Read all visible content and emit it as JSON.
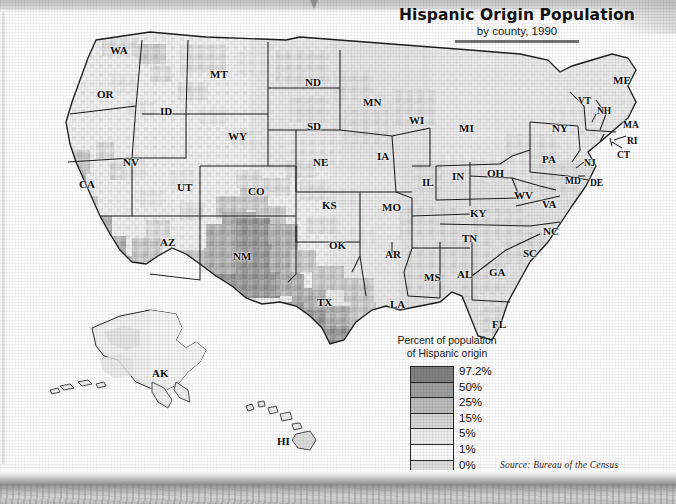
{
  "title": {
    "main": "Hispanic Origin Population",
    "subtitle": "by county, 1990"
  },
  "legend": {
    "title_line1": "Percent of population",
    "title_line2": "of Hispanic origin",
    "entries": [
      {
        "label": "97.2%",
        "color": "#818181"
      },
      {
        "label": "50%",
        "color": "#9e9e9e"
      },
      {
        "label": "25%",
        "color": "#bcbcbc"
      },
      {
        "label": "15%",
        "color": "#d6d6d6"
      },
      {
        "label": "5%",
        "color": "#ececec"
      },
      {
        "label": "1%",
        "color": "#fbfbfb"
      },
      {
        "label": "0%",
        "color": "#dedede"
      }
    ]
  },
  "source": "Source:  Bureau of the Census",
  "chart_data": {
    "type": "heatmap",
    "title": "Hispanic Origin Population",
    "subtitle": "by county, 1990",
    "variable": "Percent of population of Hispanic origin",
    "unit": "percent",
    "geography": "United States counties",
    "year": 1990,
    "legend_breaks": [
      0,
      1,
      5,
      15,
      25,
      50,
      97.2
    ],
    "legend_labels": [
      "0%",
      "1%",
      "5%",
      "15%",
      "25%",
      "50%",
      "97.2%"
    ],
    "colormap": [
      "#dedede",
      "#fbfbfb",
      "#ececec",
      "#d6d6d6",
      "#bcbcbc",
      "#9e9e9e",
      "#818181"
    ],
    "source": "Bureau of the Census",
    "series": [
      {
        "name": "NM",
        "value": 50,
        "note": "highest statewide shading; many counties above 50%"
      },
      {
        "name": "TX",
        "value": 25,
        "note": "southern and border counties darkest"
      },
      {
        "name": "CA",
        "value": 25,
        "note": "southern counties and Central Valley dark"
      },
      {
        "name": "AZ",
        "value": 15,
        "note": "southern border counties dark"
      },
      {
        "name": "CO",
        "value": 15,
        "note": "southern counties dark"
      },
      {
        "name": "NV",
        "value": 5
      },
      {
        "name": "UT",
        "value": 5
      },
      {
        "name": "ID",
        "value": 5
      },
      {
        "name": "OR",
        "value": 5
      },
      {
        "name": "WA",
        "value": 5
      },
      {
        "name": "WY",
        "value": 5
      },
      {
        "name": "MT",
        "value": 1
      },
      {
        "name": "ND",
        "value": 1
      },
      {
        "name": "SD",
        "value": 1
      },
      {
        "name": "NE",
        "value": 5
      },
      {
        "name": "KS",
        "value": 5
      },
      {
        "name": "OK",
        "value": 1
      },
      {
        "name": "MN",
        "value": 1
      },
      {
        "name": "IA",
        "value": 1
      },
      {
        "name": "MO",
        "value": 1
      },
      {
        "name": "AR",
        "value": 1
      },
      {
        "name": "LA",
        "value": 1
      },
      {
        "name": "WI",
        "value": 1
      },
      {
        "name": "IL",
        "value": 5
      },
      {
        "name": "MI",
        "value": 1
      },
      {
        "name": "IN",
        "value": 1
      },
      {
        "name": "OH",
        "value": 1
      },
      {
        "name": "KY",
        "value": 1
      },
      {
        "name": "TN",
        "value": 1
      },
      {
        "name": "MS",
        "value": 1
      },
      {
        "name": "AL",
        "value": 1
      },
      {
        "name": "GA",
        "value": 1
      },
      {
        "name": "FL",
        "value": 5
      },
      {
        "name": "SC",
        "value": 1
      },
      {
        "name": "NC",
        "value": 1
      },
      {
        "name": "VA",
        "value": 1
      },
      {
        "name": "WV",
        "value": 1
      },
      {
        "name": "MD",
        "value": 1
      },
      {
        "name": "DE",
        "value": 1
      },
      {
        "name": "PA",
        "value": 1
      },
      {
        "name": "NJ",
        "value": 5
      },
      {
        "name": "NY",
        "value": 5
      },
      {
        "name": "CT",
        "value": 5
      },
      {
        "name": "RI",
        "value": 5
      },
      {
        "name": "MA",
        "value": 1
      },
      {
        "name": "VT",
        "value": 1
      },
      {
        "name": "NH",
        "value": 1
      },
      {
        "name": "ME",
        "value": 1
      },
      {
        "name": "AK",
        "value": 1
      },
      {
        "name": "HI",
        "value": 5
      }
    ]
  },
  "state_labels": [
    {
      "abbr": "WA",
      "x": 110,
      "y": 34
    },
    {
      "abbr": "OR",
      "x": 97,
      "y": 78
    },
    {
      "abbr": "ID",
      "x": 160,
      "y": 95
    },
    {
      "abbr": "MT",
      "x": 210,
      "y": 58
    },
    {
      "abbr": "ND",
      "x": 305,
      "y": 66
    },
    {
      "abbr": "SD",
      "x": 307,
      "y": 110
    },
    {
      "abbr": "MN",
      "x": 363,
      "y": 86
    },
    {
      "abbr": "WI",
      "x": 409,
      "y": 104
    },
    {
      "abbr": "MI",
      "x": 459,
      "y": 112
    },
    {
      "abbr": "NY",
      "x": 552,
      "y": 112
    },
    {
      "abbr": "VT",
      "x": 578,
      "y": 86
    },
    {
      "abbr": "NH",
      "x": 597,
      "y": 96
    },
    {
      "abbr": "ME",
      "x": 613,
      "y": 64
    },
    {
      "abbr": "MA",
      "x": 623,
      "y": 110
    },
    {
      "abbr": "RI",
      "x": 627,
      "y": 126
    },
    {
      "abbr": "CT",
      "x": 617,
      "y": 140
    },
    {
      "abbr": "WY",
      "x": 228,
      "y": 120
    },
    {
      "abbr": "NE",
      "x": 313,
      "y": 146
    },
    {
      "abbr": "IA",
      "x": 377,
      "y": 140
    },
    {
      "abbr": "IL",
      "x": 422,
      "y": 166
    },
    {
      "abbr": "IN",
      "x": 452,
      "y": 160
    },
    {
      "abbr": "OH",
      "x": 487,
      "y": 157
    },
    {
      "abbr": "PA",
      "x": 542,
      "y": 143
    },
    {
      "abbr": "NJ",
      "x": 584,
      "y": 148
    },
    {
      "abbr": "MD",
      "x": 565,
      "y": 166
    },
    {
      "abbr": "DE",
      "x": 590,
      "y": 168
    },
    {
      "abbr": "NV",
      "x": 123,
      "y": 146
    },
    {
      "abbr": "CA",
      "x": 79,
      "y": 168
    },
    {
      "abbr": "UT",
      "x": 177,
      "y": 171
    },
    {
      "abbr": "CO",
      "x": 248,
      "y": 175
    },
    {
      "abbr": "KS",
      "x": 322,
      "y": 189
    },
    {
      "abbr": "MO",
      "x": 382,
      "y": 191
    },
    {
      "abbr": "KY",
      "x": 470,
      "y": 197
    },
    {
      "abbr": "WV",
      "x": 514,
      "y": 179
    },
    {
      "abbr": "VA",
      "x": 542,
      "y": 188
    },
    {
      "abbr": "NC",
      "x": 543,
      "y": 215
    },
    {
      "abbr": "TN",
      "x": 462,
      "y": 222
    },
    {
      "abbr": "AZ",
      "x": 160,
      "y": 226
    },
    {
      "abbr": "NM",
      "x": 233,
      "y": 240
    },
    {
      "abbr": "OK",
      "x": 329,
      "y": 229
    },
    {
      "abbr": "AR",
      "x": 385,
      "y": 238
    },
    {
      "abbr": "SC",
      "x": 523,
      "y": 237
    },
    {
      "abbr": "GA",
      "x": 489,
      "y": 256
    },
    {
      "abbr": "MS",
      "x": 424,
      "y": 261
    },
    {
      "abbr": "AL",
      "x": 457,
      "y": 258
    },
    {
      "abbr": "TX",
      "x": 317,
      "y": 286
    },
    {
      "abbr": "LA",
      "x": 390,
      "y": 288
    },
    {
      "abbr": "FL",
      "x": 492,
      "y": 308
    },
    {
      "abbr": "AK",
      "x": 152,
      "y": 357
    },
    {
      "abbr": "HI",
      "x": 277,
      "y": 425
    }
  ]
}
